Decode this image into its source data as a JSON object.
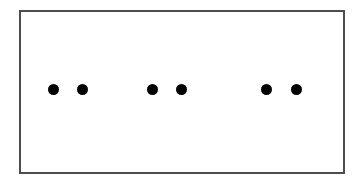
{
  "figure": {
    "canvas": {
      "width": 360,
      "height": 184,
      "background_color": "#ffffff"
    },
    "frame": {
      "name": "rectangle-border",
      "x": 19,
      "y": 10,
      "width": 326,
      "height": 164,
      "border_color": "#4d4d4d",
      "border_width": 2,
      "fill_color": "#ffffff"
    },
    "dots": {
      "count": 6,
      "color": "#000000",
      "diameter": 11,
      "baseline_y": 89,
      "items": [
        {
          "label": "dot-1",
          "group": "pair-1",
          "cx": 53,
          "cy": 89,
          "r": 5.5
        },
        {
          "label": "dot-2",
          "group": "pair-1",
          "cx": 82,
          "cy": 89,
          "r": 5.5
        },
        {
          "label": "dot-3",
          "group": "pair-2",
          "cx": 152,
          "cy": 89,
          "r": 5.5
        },
        {
          "label": "dot-4",
          "group": "pair-2",
          "cx": 181,
          "cy": 89,
          "r": 5.5
        },
        {
          "label": "dot-5",
          "group": "pair-3",
          "cx": 266,
          "cy": 89,
          "r": 5.5
        },
        {
          "label": "dot-6",
          "group": "pair-3",
          "cx": 296,
          "cy": 89,
          "r": 5.5
        }
      ],
      "groups": [
        {
          "name": "pair-1",
          "members": [
            "dot-1",
            "dot-2"
          ],
          "intra_gap": 29
        },
        {
          "name": "pair-2",
          "members": [
            "dot-3",
            "dot-4"
          ],
          "intra_gap": 29
        },
        {
          "name": "pair-3",
          "members": [
            "dot-5",
            "dot-6"
          ],
          "intra_gap": 30
        }
      ],
      "inter_group_gaps": [
        70,
        85
      ]
    }
  }
}
